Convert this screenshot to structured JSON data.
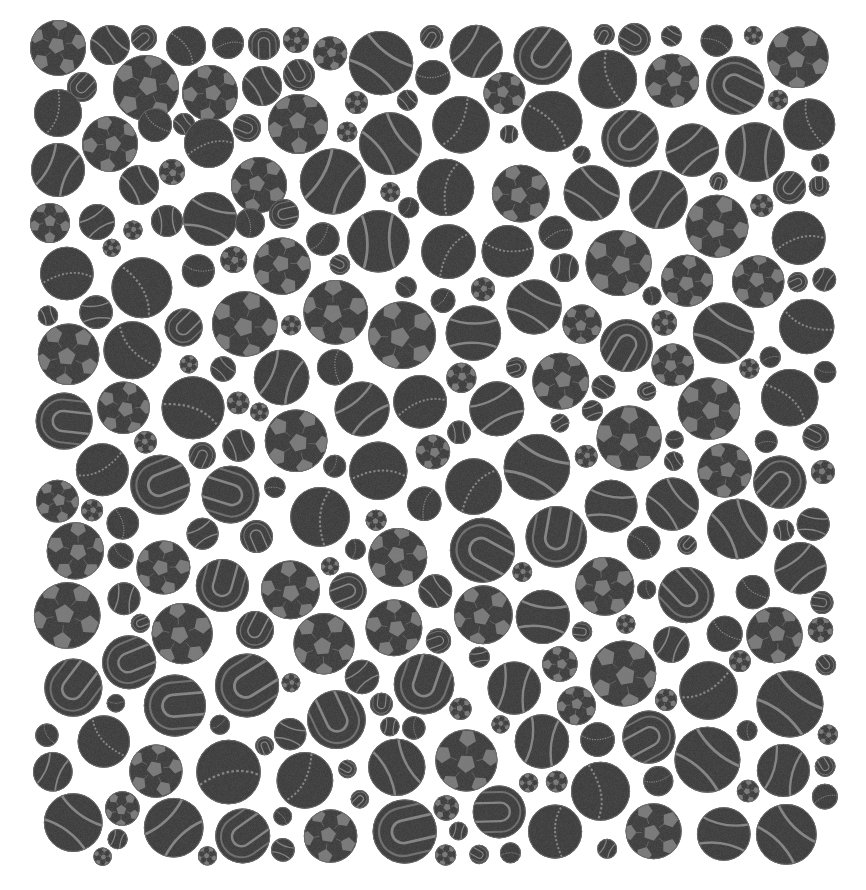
{
  "image": {
    "description": "Dense grayscale packing of sports balls on a white background",
    "width": 866,
    "height": 890,
    "background": "#ffffff",
    "region": {
      "x0": 33,
      "y0": 22,
      "x1": 838,
      "y1": 866
    }
  },
  "palette": {
    "ball_body": "#363636",
    "ball_texture": "#2c2c2c",
    "panel": "#7e7e7e",
    "seam": "#8a8a8a",
    "outline": "#6a6a6a"
  },
  "ball_types": [
    "soccer",
    "tennis",
    "tennis-u",
    "cricket"
  ],
  "known_balls": [
    {
      "cx": 58,
      "cy": 48,
      "r": 28,
      "type": "soccer"
    },
    {
      "cx": 110,
      "cy": 45,
      "r": 20,
      "type": "tennis"
    },
    {
      "cx": 144,
      "cy": 38,
      "r": 13,
      "type": "tennis-u"
    },
    {
      "cx": 186,
      "cy": 46,
      "r": 20,
      "type": "cricket"
    },
    {
      "cx": 228,
      "cy": 43,
      "r": 16,
      "type": "cricket"
    },
    {
      "cx": 264,
      "cy": 44,
      "r": 16,
      "type": "tennis-u"
    },
    {
      "cx": 296,
      "cy": 40,
      "r": 13,
      "type": "soccer"
    },
    {
      "cx": 82,
      "cy": 87,
      "r": 15,
      "type": "tennis-u"
    },
    {
      "cx": 146,
      "cy": 88,
      "r": 33,
      "type": "soccer"
    },
    {
      "cx": 210,
      "cy": 93,
      "r": 28,
      "type": "soccer"
    },
    {
      "cx": 262,
      "cy": 86,
      "r": 20,
      "type": "tennis"
    },
    {
      "cx": 299,
      "cy": 75,
      "r": 16,
      "type": "tennis-u"
    },
    {
      "cx": 58,
      "cy": 113,
      "r": 24,
      "type": "cricket"
    },
    {
      "cx": 110,
      "cy": 144,
      "r": 28,
      "type": "soccer"
    },
    {
      "cx": 155,
      "cy": 125,
      "r": 17,
      "type": "cricket"
    },
    {
      "cx": 184,
      "cy": 124,
      "r": 11,
      "type": "tennis"
    },
    {
      "cx": 209,
      "cy": 143,
      "r": 25,
      "type": "cricket"
    },
    {
      "cx": 247,
      "cy": 128,
      "r": 14,
      "type": "tennis-u"
    },
    {
      "cx": 298,
      "cy": 124,
      "r": 30,
      "type": "soccer"
    },
    {
      "cx": 58,
      "cy": 170,
      "r": 27,
      "type": "tennis"
    },
    {
      "cx": 172,
      "cy": 172,
      "r": 13,
      "type": "soccer"
    },
    {
      "cx": 139,
      "cy": 185,
      "r": 20,
      "type": "tennis"
    },
    {
      "cx": 259,
      "cy": 185,
      "r": 28,
      "type": "soccer"
    },
    {
      "cx": 50,
      "cy": 223,
      "r": 20,
      "type": "soccer"
    },
    {
      "cx": 97,
      "cy": 222,
      "r": 18,
      "type": "tennis"
    },
    {
      "cx": 167,
      "cy": 221,
      "r": 16,
      "type": "tennis"
    },
    {
      "cx": 210,
      "cy": 219,
      "r": 27,
      "type": "tennis"
    },
    {
      "cx": 250,
      "cy": 223,
      "r": 15,
      "type": "cricket"
    },
    {
      "cx": 284,
      "cy": 214,
      "r": 15,
      "type": "tennis-u"
    }
  ],
  "fill": {
    "seed": 20240611,
    "attempts": 60000,
    "r_min": 9,
    "r_max": 34,
    "gap": 2.5,
    "type_weights": {
      "soccer": 0.3,
      "tennis": 0.25,
      "tennis-u": 0.2,
      "cricket": 0.25
    }
  }
}
